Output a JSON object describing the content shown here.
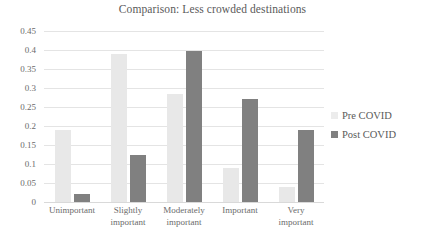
{
  "chart_data": {
    "type": "bar",
    "title": "Comparison: Less crowded destinations",
    "xlabel": "",
    "ylabel": "",
    "ylim": [
      0,
      0.45
    ],
    "yticks": [
      "0",
      "0.05",
      "0.1",
      "0.15",
      "0.2",
      "0.25",
      "0.3",
      "0.35",
      "0.4",
      "0.45"
    ],
    "ytick_values": [
      0,
      0.05,
      0.1,
      0.15,
      0.2,
      0.25,
      0.3,
      0.35,
      0.4,
      0.45
    ],
    "grid": true,
    "legend_position": "right",
    "categories": [
      "Unimportant",
      "Slightly important",
      "Moderately important",
      "Important",
      "Very important"
    ],
    "series": [
      {
        "name": "Pre COVID",
        "color": "#e8e8e8",
        "values": [
          0.19,
          0.39,
          0.285,
          0.09,
          0.04
        ]
      },
      {
        "name": "Post COVID",
        "color": "#808080",
        "values": [
          0.022,
          0.125,
          0.398,
          0.27,
          0.19
        ]
      }
    ]
  },
  "legend": {
    "items": [
      {
        "label": "Pre COVID",
        "swatch": "pre"
      },
      {
        "label": "Post COVID",
        "swatch": "post"
      }
    ]
  }
}
